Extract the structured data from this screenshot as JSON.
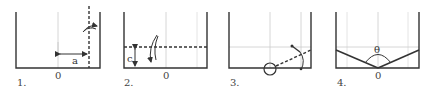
{
  "panels": [
    {
      "number": "1.",
      "origin_label": "0",
      "dimension_label": "a"
    },
    {
      "number": "2.",
      "origin_label": "0",
      "dimension_label": "c"
    },
    {
      "number": "3.",
      "origin_label": ""
    },
    {
      "number": "4.",
      "origin_label": "0",
      "angle_label": "θ"
    }
  ],
  "colors": {
    "ink": "#333333",
    "guide": "#cccccc"
  }
}
